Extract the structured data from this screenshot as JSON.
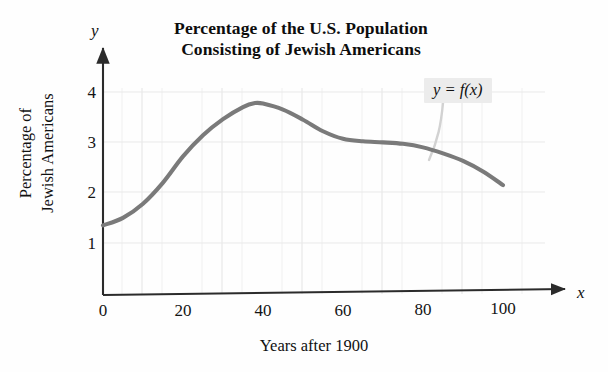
{
  "title": {
    "line1": "Percentage of the U.S. Population",
    "line2": "Consisting of Jewish Americans"
  },
  "axes": {
    "x_letter": "x",
    "y_letter": "y",
    "x_title": "Years after 1900",
    "y_title_line1": "Percentage of",
    "y_title_line2": "Jewish Americans"
  },
  "annotation": {
    "label": "y = f(x)"
  },
  "ticks": {
    "x": [
      "0",
      "20",
      "40",
      "60",
      "80",
      "100"
    ],
    "y": [
      "1",
      "2",
      "3",
      "4"
    ]
  },
  "colors": {
    "curve": "#7a7a7a",
    "axis": "#2b2b2b",
    "grid": "#ececec",
    "annotation_bg": "#ececec"
  },
  "chart_data": {
    "type": "line",
    "title": "Percentage of the U.S. Population Consisting of Jewish Americans",
    "xlabel": "Years after 1900",
    "ylabel": "Percentage of Jewish Americans",
    "xlim": [
      0,
      108
    ],
    "ylim": [
      0,
      4.4
    ],
    "xticks": [
      0,
      20,
      40,
      60,
      80,
      100
    ],
    "yticks": [
      1,
      2,
      3,
      4
    ],
    "grid": true,
    "grid_minor_step_x": 10,
    "grid_minor_step_y": 1,
    "legend": "none",
    "annotations": [
      {
        "text": "y = f(x)",
        "x": 88,
        "y": 4.05,
        "points_to_x": 76,
        "points_to_y": 3.0
      }
    ],
    "series": [
      {
        "name": "y = f(x)",
        "color": "#7a7a7a",
        "x": [
          0,
          5,
          10,
          15,
          20,
          25,
          30,
          35,
          38,
          40,
          45,
          50,
          55,
          60,
          65,
          70,
          75,
          80,
          85,
          90,
          95,
          100
        ],
        "values": [
          1.35,
          1.5,
          1.78,
          2.2,
          2.72,
          3.14,
          3.46,
          3.7,
          3.78,
          3.77,
          3.65,
          3.45,
          3.22,
          3.07,
          3.02,
          3.0,
          2.97,
          2.9,
          2.78,
          2.63,
          2.42,
          2.15
        ]
      }
    ]
  }
}
